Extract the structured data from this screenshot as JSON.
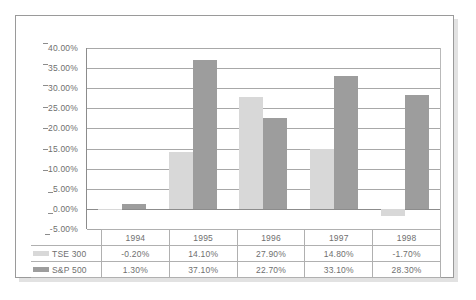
{
  "chart_data": {
    "type": "bar",
    "title": "",
    "xlabel": "",
    "ylabel": "",
    "categories": [
      "1994",
      "1995",
      "1996",
      "1997",
      "1998"
    ],
    "series": [
      {
        "name": "TSE 300",
        "color": "#d8d8d8",
        "values": [
          -0.2,
          14.1,
          27.9,
          14.8,
          -1.7
        ],
        "labels": [
          "-0.20%",
          "14.10%",
          "27.90%",
          "14.80%",
          "-1.70%"
        ]
      },
      {
        "name": "S&P 500",
        "color": "#9d9d9d",
        "values": [
          1.3,
          37.1,
          22.7,
          33.1,
          28.3
        ],
        "labels": [
          "1.30%",
          "37.10%",
          "22.70%",
          "33.10%",
          "28.30%"
        ]
      }
    ],
    "ylim": [
      -5,
      40
    ],
    "ytick_values": [
      40,
      35,
      30,
      25,
      20,
      15,
      10,
      5,
      0,
      -5
    ],
    "ytick_labels": [
      "40.00%",
      "35.00%",
      "30.00%",
      "25.00%",
      "20.00%",
      "15.00%",
      "10.00%",
      "5.00%",
      "0.00%",
      "-5.00%"
    ],
    "grid": true,
    "legend_position": "data-table-left"
  },
  "colors": {
    "series0": "#d8d8d8",
    "series1": "#9d9d9d",
    "gridline": "#a8a8a8",
    "axis": "#8c8c8c",
    "text": "#6f6f6f",
    "frame_border": "#9a9a9a"
  }
}
